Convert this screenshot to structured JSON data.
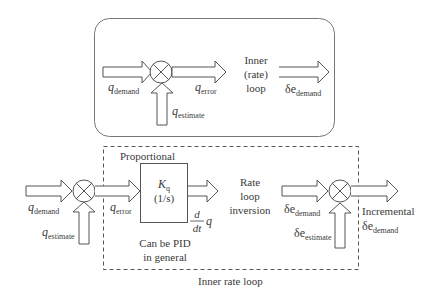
{
  "top_diagram": {
    "title": "Inner (rate) loop",
    "title_lines": [
      "Inner",
      "(rate)",
      "loop"
    ],
    "input": {
      "symbol": "q",
      "subscript": "demand"
    },
    "feedback": {
      "symbol": "q",
      "subscript": "estimate"
    },
    "error": {
      "symbol": "q",
      "subscript": "error"
    },
    "output": {
      "symbol": "δe",
      "subscript": "demand"
    }
  },
  "bottom_diagram": {
    "container_label": "Inner rate loop",
    "input": {
      "symbol": "q",
      "subscript": "demand"
    },
    "feedback": {
      "symbol": "q",
      "subscript": "estimate"
    },
    "error": {
      "symbol": "q",
      "subscript": "error"
    },
    "controller": {
      "header": "Proportional",
      "gain_symbol": "K",
      "gain_subscript": "q",
      "units": "(1/s)",
      "note_lines": [
        "Can be PID",
        "in general"
      ]
    },
    "controller_output": {
      "numerator": "d",
      "denominator": "dt",
      "symbol": "q"
    },
    "inversion_lines": [
      "Rate",
      "loop",
      "inversion"
    ],
    "inversion_output": {
      "symbol": "δe",
      "subscript": "demand"
    },
    "second_feedback": {
      "symbol": "δe",
      "subscript": "estimate"
    },
    "final_output": {
      "prefix": "Incremental",
      "symbol": "δe",
      "subscript": "demand"
    }
  },
  "colors": {
    "stroke": "#555555",
    "text": "#3a3a3a",
    "background": "#ffffff"
  }
}
